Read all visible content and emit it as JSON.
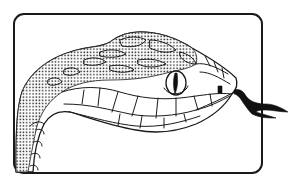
{
  "illustration": {
    "subject": "snake head",
    "style": "black ink line drawing",
    "background_color": "#ffffff",
    "ink_color": "#1a1a1a",
    "frame": {
      "shape": "rounded-rectangle",
      "x": 14,
      "y": 14,
      "width": 248,
      "height": 159,
      "corner_radius": 10
    },
    "elements": [
      {
        "name": "head",
        "icon": "snake-head-icon"
      },
      {
        "name": "eye",
        "icon": "snake-eye-icon",
        "pupil": "vertical-slit"
      },
      {
        "name": "nostril",
        "icon": "nostril-icon"
      },
      {
        "name": "tongue",
        "icon": "forked-tongue-icon",
        "extends_outside_frame": true
      },
      {
        "name": "scales",
        "pattern": "stippled dorsal scales, open ventral/labial scales"
      }
    ]
  }
}
